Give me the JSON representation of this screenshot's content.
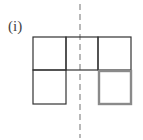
{
  "label": "(i)",
  "figure": {
    "cells": [
      {
        "row": 0,
        "col": 0,
        "highlight": false
      },
      {
        "row": 0,
        "col": 1,
        "highlight": false
      },
      {
        "row": 0,
        "col": 2,
        "highlight": false
      },
      {
        "row": 1,
        "col": 0,
        "highlight": false
      },
      {
        "row": 1,
        "col": 2,
        "highlight": true
      }
    ],
    "colors": {
      "line": "#333333",
      "highlight": "#8a8a8a",
      "axis": "#888888"
    }
  }
}
